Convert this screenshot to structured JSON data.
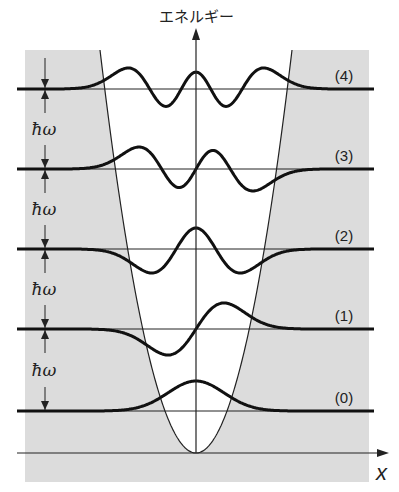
{
  "figure": {
    "y_axis_label": "エネルギー",
    "x_axis_label": "x",
    "spacing_label": "ħω",
    "level_labels": [
      "(0)",
      "(1)",
      "(2)",
      "(3)",
      "(4)"
    ],
    "colors": {
      "background_shade": "#dcdcdc",
      "well_interior": "#ffffff",
      "line": "#111111"
    }
  },
  "chart_data": {
    "type": "diagram",
    "ylabel": "エネルギー",
    "xlabel": "x",
    "levels": [
      {
        "n": 0,
        "label": "(0)",
        "energy_units": 0.5
      },
      {
        "n": 1,
        "label": "(1)",
        "energy_units": 1.5
      },
      {
        "n": 2,
        "label": "(2)",
        "energy_units": 2.5
      },
      {
        "n": 3,
        "label": "(3)",
        "energy_units": 3.5
      },
      {
        "n": 4,
        "label": "(4)",
        "energy_units": 4.5
      }
    ],
    "level_spacing": "ħω",
    "potential": "parabolic V(x) ∝ x²"
  }
}
